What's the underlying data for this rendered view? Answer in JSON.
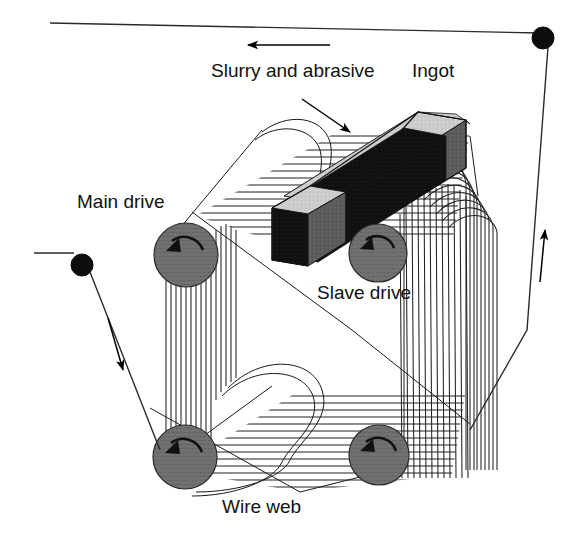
{
  "figure": {
    "kind": "technical-line-diagram",
    "background_color": "#ffffff",
    "line_color": "#1a1a1a"
  },
  "labels": {
    "slurry": "Slurry and abrasive",
    "ingot": "Ingot",
    "main_drive": "Main drive",
    "slave_drive": "Slave drive",
    "wire_web": "Wire web"
  },
  "colors": {
    "pulley_gray": "#6e6e6e",
    "ingot_black": "#101010",
    "ingot_top_light": "#cfcfcf",
    "ingot_side_gray": "#5a5a5a",
    "spool_black": "#0d0d0d",
    "line": "#1a1a1a"
  },
  "parts": [
    {
      "name": "main-drive-pulley",
      "label": "Main drive",
      "cx": 186,
      "cy": 255,
      "r": 32,
      "rotation": "counter-clockwise"
    },
    {
      "name": "slave-drive-pulley",
      "label": "Slave drive",
      "cx": 378,
      "cy": 253,
      "r": 29,
      "rotation": "counter-clockwise"
    },
    {
      "name": "lower-left-pulley",
      "label": "",
      "cx": 185,
      "cy": 457,
      "r": 32,
      "rotation": "counter-clockwise"
    },
    {
      "name": "lower-right-pulley",
      "label": "",
      "cx": 379,
      "cy": 455,
      "r": 30,
      "rotation": "counter-clockwise"
    },
    {
      "name": "supply-spool",
      "label": "",
      "cx": 543,
      "cy": 38,
      "r": 11,
      "rotation": ""
    },
    {
      "name": "takeup-spool",
      "label": "",
      "cx": 82,
      "cy": 265,
      "r": 11,
      "rotation": ""
    }
  ],
  "arrows": [
    {
      "name": "top-feed-arrow",
      "direction": "left",
      "x1": 330,
      "y1": 45,
      "x2": 245,
      "y2": 45
    },
    {
      "name": "right-feed-arrow",
      "direction": "up",
      "x1": 541,
      "y1": 280,
      "x2": 545,
      "y2": 228
    },
    {
      "name": "left-exit-arrow",
      "direction": "down",
      "x1": 110,
      "y1": 320,
      "x2": 124,
      "y2": 372
    },
    {
      "name": "slurry-pointer",
      "direction": "down-right",
      "x1": 303,
      "y1": 100,
      "x2": 352,
      "y2": 133
    }
  ],
  "ingot": {
    "name": "ingot-block",
    "orientation": "diagonal, resting on top of wire web",
    "faces": [
      "top-light-gray",
      "top-black",
      "front-black",
      "right-gray"
    ]
  },
  "wire_web": {
    "name": "wire-web",
    "top_face_wires": 14,
    "bottom_face_wires": 14,
    "left_face_wires": 12,
    "right_face_wires": 18,
    "description": "Parallel wires wrapped around four pulleys forming a cutting web"
  }
}
